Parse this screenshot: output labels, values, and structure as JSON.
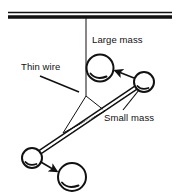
{
  "figure": {
    "width": 179,
    "height": 196,
    "background_color": "#ffffff",
    "stroke_color": "#111111"
  },
  "labels": {
    "large_mass": "Large mass",
    "thin_wire": "Thin wire",
    "small_mass": "Small mass"
  },
  "components": {
    "ceiling": {
      "name": "ceiling-support-bar",
      "description": "horizontal double-line support bar across top",
      "x1": 8,
      "x2": 172,
      "y_top": 12,
      "y_bottom": 18
    },
    "wire": {
      "name": "thin-suspension-wire",
      "description": "vertical thin wire from ceiling to yoke",
      "x": 86,
      "y1": 16,
      "y2": 96
    },
    "yoke": {
      "name": "triangular-yoke",
      "description": "V-shaped wire yoke joining suspension wire to rod",
      "apex_x": 86,
      "apex_y": 96,
      "left_x": 63,
      "left_y": 133,
      "right_x": 105,
      "right_y": 111
    },
    "rod": {
      "name": "horizontal-rod",
      "description": "rigid rod carrying the two small masses",
      "x1": 143,
      "y1": 83,
      "x2": 33,
      "y2": 157
    },
    "circles": [
      {
        "name": "large-mass-upper",
        "role": "large mass",
        "cx": 100,
        "cy": 68,
        "r": 13.5
      },
      {
        "name": "small-mass-right",
        "role": "small mass",
        "cx": 144,
        "cy": 82,
        "r": 10
      },
      {
        "name": "small-mass-left",
        "role": "small mass",
        "cx": 32,
        "cy": 158,
        "r": 10
      },
      {
        "name": "large-mass-lower",
        "role": "large mass",
        "cx": 72,
        "cy": 177,
        "r": 14
      }
    ],
    "arrows": [
      {
        "name": "attraction-arrow-upper",
        "from_x": 133,
        "from_y": 78,
        "to_x": 114,
        "to_y": 70,
        "description": "small mass attracted toward large mass"
      },
      {
        "name": "attraction-arrow-lower",
        "from_x": 41,
        "from_y": 162,
        "to_x": 58,
        "to_y": 172,
        "description": "small mass attracted toward large mass"
      }
    ],
    "leaders": [
      {
        "name": "leader-thin-wire",
        "from_x": 40,
        "from_y": 76,
        "to_x": 79,
        "to_y": 92
      },
      {
        "name": "leader-small-mass",
        "from_x": 123,
        "from_y": 111,
        "to_x": 139,
        "to_y": 90
      }
    ]
  }
}
